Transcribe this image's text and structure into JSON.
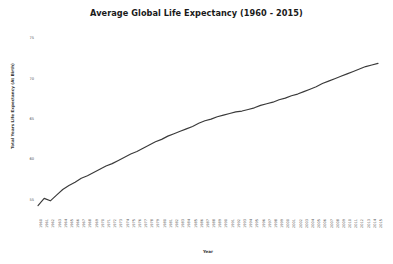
{
  "chart_data": {
    "type": "line",
    "title": "Average Global Life Expectancy (1960 - 2015)",
    "xlabel": "Year",
    "ylabel": "Total Years Life Expectancy (At Birth)",
    "grid": false,
    "legend": null,
    "line_color": "#3a3a3a",
    "background_color": "#ffffff",
    "ylim": [
      53.0,
      76.0
    ],
    "yticks": [
      55,
      60,
      65,
      70,
      75
    ],
    "ytick_labels": [
      "55",
      "60",
      "65",
      "70",
      "75"
    ],
    "xlim": [
      1960,
      2015
    ],
    "x": [
      1960,
      1961,
      1962,
      1963,
      1964,
      1965,
      1966,
      1967,
      1968,
      1969,
      1970,
      1971,
      1972,
      1973,
      1974,
      1975,
      1976,
      1977,
      1978,
      1979,
      1980,
      1981,
      1982,
      1983,
      1984,
      1985,
      1986,
      1987,
      1988,
      1989,
      1990,
      1991,
      1992,
      1993,
      1994,
      1995,
      1996,
      1997,
      1998,
      1999,
      2000,
      2001,
      2002,
      2003,
      2004,
      2005,
      2006,
      2007,
      2008,
      2009,
      2010,
      2011,
      2012,
      2013,
      2014,
      2015
    ],
    "categories": [
      "1960",
      "1961",
      "1962",
      "1963",
      "1964",
      "1965",
      "1966",
      "1967",
      "1968",
      "1969",
      "1970",
      "1971",
      "1972",
      "1973",
      "1974",
      "1975",
      "1976",
      "1977",
      "1978",
      "1979",
      "1980",
      "1981",
      "1982",
      "1983",
      "1984",
      "1985",
      "1986",
      "1987",
      "1988",
      "1989",
      "1990",
      "1991",
      "1992",
      "1993",
      "1994",
      "1995",
      "1996",
      "1997",
      "1998",
      "1999",
      "2000",
      "2001",
      "2002",
      "2003",
      "2004",
      "2005",
      "2006",
      "2007",
      "2008",
      "2009",
      "2010",
      "2011",
      "2012",
      "2013",
      "2014",
      "2015"
    ],
    "values": [
      54.4,
      55.3,
      55.0,
      55.7,
      56.4,
      56.9,
      57.3,
      57.8,
      58.1,
      58.5,
      58.9,
      59.3,
      59.6,
      60.0,
      60.4,
      60.8,
      61.1,
      61.5,
      61.9,
      62.3,
      62.6,
      63.0,
      63.3,
      63.6,
      63.9,
      64.2,
      64.6,
      64.9,
      65.1,
      65.4,
      65.6,
      65.8,
      66.0,
      66.1,
      66.3,
      66.5,
      66.8,
      67.0,
      67.2,
      67.5,
      67.7,
      68.0,
      68.2,
      68.5,
      68.8,
      69.1,
      69.5,
      69.8,
      70.1,
      70.4,
      70.7,
      71.0,
      71.3,
      71.6,
      71.8,
      72.0
    ]
  }
}
